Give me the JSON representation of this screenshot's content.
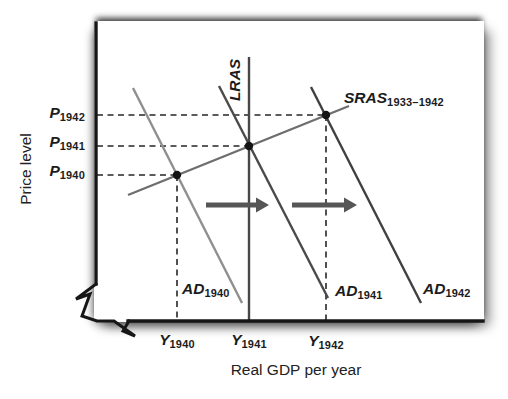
{
  "figure": {
    "x_axis_title": "Real GDP per year",
    "y_axis_title": "Price level"
  },
  "labels": {
    "p1942": {
      "base": "P",
      "sub": "1942"
    },
    "p1941": {
      "base": "P",
      "sub": "1941"
    },
    "p1940": {
      "base": "P",
      "sub": "1940"
    },
    "y1940": {
      "base": "Y",
      "sub": "1940"
    },
    "y1941": {
      "base": "Y",
      "sub": "1941"
    },
    "y1942": {
      "base": "Y",
      "sub": "1942"
    },
    "ad1940": {
      "base": "AD",
      "sub": "1940"
    },
    "ad1941": {
      "base": "AD",
      "sub": "1941"
    },
    "ad1942": {
      "base": "AD",
      "sub": "1942"
    },
    "sras": {
      "base": "SRAS",
      "sub": "1933–1942"
    },
    "lras": {
      "base": "LRAS",
      "sub": ""
    }
  },
  "chart_data": {
    "type": "line",
    "xlabel": "Real GDP per year",
    "ylabel": "Price level",
    "x_tick_labels": [
      "Y 1940",
      "Y 1941",
      "Y 1942"
    ],
    "y_tick_labels": [
      "P 1942",
      "P 1941",
      "P 1940"
    ],
    "legend": "none",
    "grid": false,
    "axis_color": "#161616",
    "guide_color": "#262626",
    "point_color": "#141414",
    "arrow_color": "#565656",
    "axes": {
      "paths": [
        {
          "id": "y-axis",
          "d": "M96,23 L96,284",
          "w": 3.4
        },
        {
          "id": "axis-break",
          "d": "M96,284 L76,299 L90,294 L82,316 L97,321 L114,321 L135,336 L123,331 L129,321",
          "w": 3
        },
        {
          "id": "x-axis",
          "d": "M128,321 L483,321",
          "w": 3.4
        }
      ]
    },
    "curves": [
      {
        "id": "curve-ad-1940",
        "name": "AD 1940 aggregate demand",
        "color": "#8f8f8f",
        "width": 2.4,
        "px": [
          [
            133,
            88
          ],
          [
            242,
            303
          ]
        ]
      },
      {
        "id": "curve-sras-1933-1942",
        "name": "SRAS 1933–1942 short-run aggregate supply",
        "color": "#6e6e6e",
        "width": 2.4,
        "px": [
          [
            128,
            195
          ],
          [
            349,
            106
          ]
        ]
      },
      {
        "id": "curve-lras",
        "name": "LRAS long-run aggregate supply",
        "color": "#474747",
        "width": 2.4,
        "px": [
          [
            249,
            57
          ],
          [
            249,
            321
          ]
        ]
      },
      {
        "id": "curve-ad-1941",
        "name": "AD 1941 aggregate demand",
        "color": "#4a4a4a",
        "width": 2.4,
        "px": [
          [
            219,
            86
          ],
          [
            328,
            298
          ]
        ]
      },
      {
        "id": "curve-ad-1942",
        "name": "AD 1942 aggregate demand",
        "color": "#404040",
        "width": 2.4,
        "px": [
          [
            311,
            87
          ],
          [
            421,
            303
          ]
        ]
      }
    ],
    "guides": [
      {
        "id": "p1942-dash",
        "from": [
          97,
          115
        ],
        "to": [
          326,
          115
        ]
      },
      {
        "id": "p1941-dash",
        "from": [
          97,
          146
        ],
        "to": [
          249,
          146
        ]
      },
      {
        "id": "p1940-dash",
        "from": [
          97,
          175
        ],
        "to": [
          177,
          175
        ]
      },
      {
        "id": "y1940-dash",
        "from": [
          177,
          175
        ],
        "to": [
          177,
          321
        ]
      },
      {
        "id": "y1942-dash",
        "from": [
          326,
          115
        ],
        "to": [
          326,
          321
        ]
      }
    ],
    "points": [
      {
        "id": "equilibrium-1940",
        "px": [
          177,
          175
        ],
        "x_label": "Y 1940",
        "y_label": "P 1940"
      },
      {
        "id": "equilibrium-1941",
        "px": [
          249,
          146
        ],
        "x_label": "Y 1941",
        "y_label": "P 1941"
      },
      {
        "id": "equilibrium-1942",
        "px": [
          326,
          115
        ],
        "x_label": "Y 1942",
        "y_label": "P 1942"
      }
    ],
    "arrows": [
      {
        "id": "ad-shift-arrow-1",
        "y": 205,
        "x1": 206,
        "x2": 269
      },
      {
        "id": "ad-shift-arrow-2",
        "y": 205,
        "x1": 292,
        "x2": 357
      }
    ]
  }
}
